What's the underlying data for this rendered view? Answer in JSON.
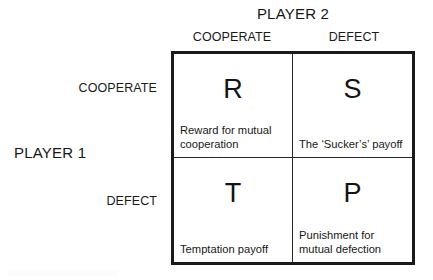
{
  "diagram": {
    "title_top": "PLAYER 2",
    "title_left": "PLAYER 1",
    "column_headers": [
      "COOPERATE",
      "DEFECT"
    ],
    "row_headers": [
      "COOPERATE",
      "DEFECT"
    ],
    "cells": [
      {
        "letter": "R",
        "description": "Reward for mutual cooperation",
        "row": "COOPERATE",
        "column": "COOPERATE"
      },
      {
        "letter": "S",
        "description": "The ‘Sucker’s’ payoff",
        "row": "COOPERATE",
        "column": "DEFECT"
      },
      {
        "letter": "T",
        "description": "Temptation payoff",
        "row": "DEFECT",
        "column": "COOPERATE"
      },
      {
        "letter": "P",
        "description": "Punishment for mutual defection",
        "row": "DEFECT",
        "column": "DEFECT"
      }
    ],
    "colors": {
      "background": "#ffffff",
      "border": "#1a1a1a",
      "divider": "#2a2a2a",
      "text": "#161616"
    }
  }
}
